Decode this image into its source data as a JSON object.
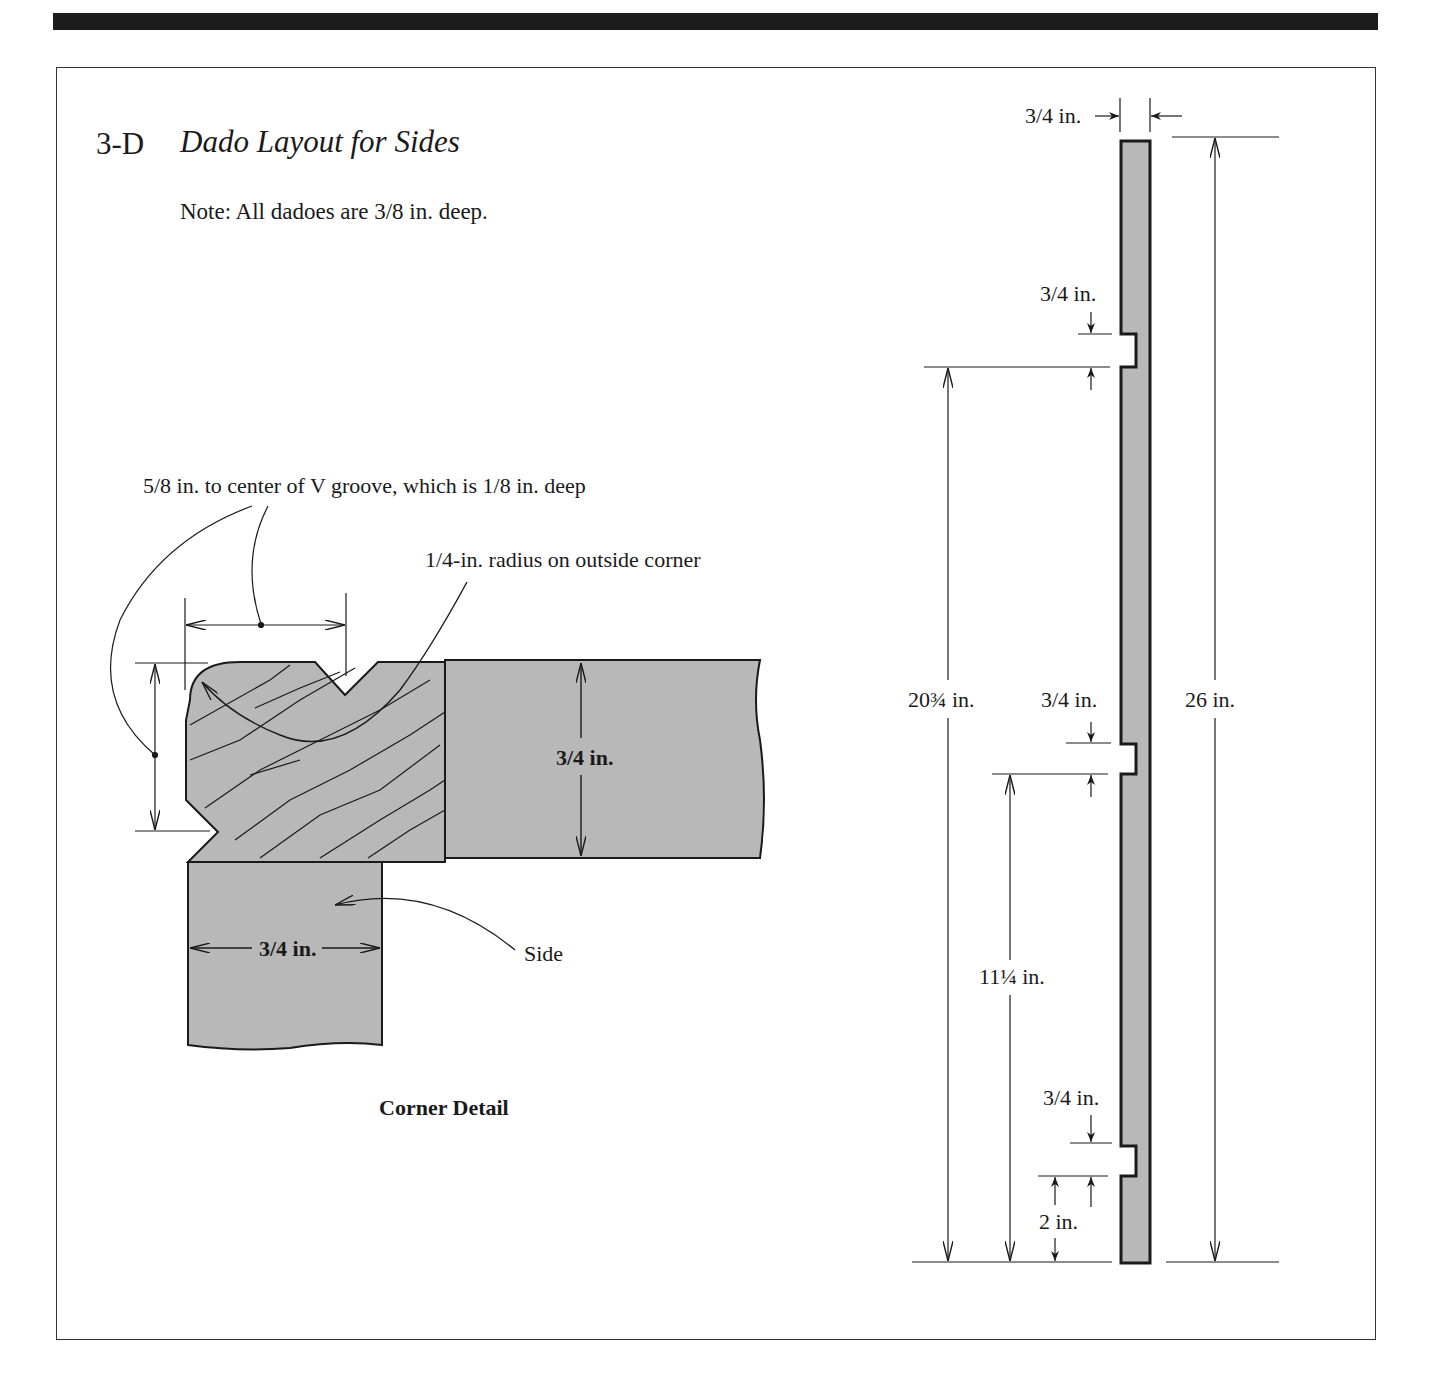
{
  "figure": {
    "number": "3-D",
    "title": "Dado Layout for Sides",
    "note": "Note: All dadoes are 3/8 in. deep."
  },
  "corner_detail": {
    "caption": "Corner Detail",
    "callouts": {
      "v_groove": "5/8 in. to center of V groove, which is 1/8 in. deep",
      "radius": "1/4-in. radius on outside corner",
      "side": "Side"
    },
    "dimensions": {
      "top_thickness": "3/4 in.",
      "side_thickness": "3/4 in."
    }
  },
  "side_elevation": {
    "dimensions": {
      "board_thickness": "3/4 in.",
      "overall_height": "26 in.",
      "top_dado_height": "20¾ in.",
      "middle_dado_height": "11¼ in.",
      "bottom_dado_height": "2 in.",
      "top_dado_width": "3/4 in.",
      "middle_dado_width": "3/4 in.",
      "bottom_dado_width": "3/4 in."
    }
  },
  "colors": {
    "wood_fill": "#b8b8b8",
    "line": "#1a1a1a",
    "top_rule": "#1c1c1c"
  }
}
